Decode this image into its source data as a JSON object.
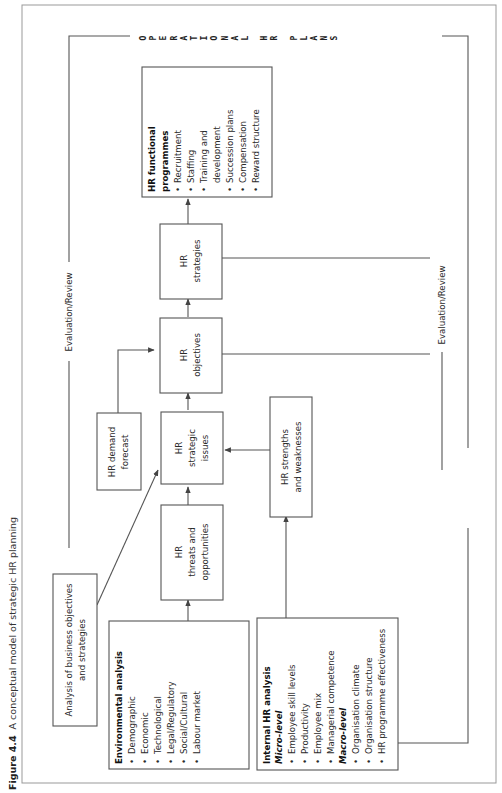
{
  "caption": {
    "figure_label": "Figure 4.4",
    "title": "A conceptual model of strategic HR planning"
  },
  "boxes": {
    "business_analysis": {
      "line1": "Analysis of business objectives",
      "line2": "and strategies"
    },
    "environmental_analysis": {
      "title": "Environmental analysis",
      "items": [
        "Demographic",
        "Economic",
        "Technological",
        "Legal/Regulatory",
        "Social/Cultural",
        "Labour market"
      ]
    },
    "internal_hr_analysis": {
      "title": "Internal HR analysis",
      "micro_label": "Micro-level",
      "micro_items": [
        "Employee skill levels",
        "Productivity",
        "Employee mix",
        "Managerial competence"
      ],
      "macro_label": "Macro-level",
      "macro_items": [
        "Organisation climate",
        "Organisation structure",
        "HR programme effectiveness"
      ]
    },
    "threats_opportunities": {
      "line1": "HR",
      "line2": "threats and",
      "line3": "opportunities"
    },
    "strategic_issues": {
      "line1": "HR",
      "line2": "strategic",
      "line3": "issues"
    },
    "demand_forecast": {
      "line1": "HR demand",
      "line2": "forecast"
    },
    "strengths_weaknesses": {
      "line1": "HR strengths",
      "line2": "and weaknesses"
    },
    "objectives": {
      "line1": "HR",
      "line2": "objectives"
    },
    "strategies": {
      "line1": "HR",
      "line2": "strategies"
    },
    "functional_programmes": {
      "title1": "HR functional",
      "title2": "programmes",
      "items": [
        "Recruitment",
        "Staffing",
        "Training and",
        "development",
        "Succession plans",
        "Compensation",
        "Reward structure"
      ],
      "bullets": [
        true,
        true,
        true,
        false,
        true,
        true,
        true
      ]
    }
  },
  "labels": {
    "evaluation_review_top": "Evaluation/Review",
    "evaluation_review_bottom": "Evaluation/Review",
    "operational": [
      "O",
      "P",
      "E",
      "R",
      "A",
      "T",
      "I",
      "O",
      "N",
      "A",
      "L"
    ],
    "hr": [
      "H",
      "R"
    ],
    "plans": [
      "P",
      "L",
      "A",
      "N",
      "S"
    ]
  },
  "colors": {
    "line": "#555555",
    "frame": "#999999",
    "text": "#2a2a2a"
  }
}
